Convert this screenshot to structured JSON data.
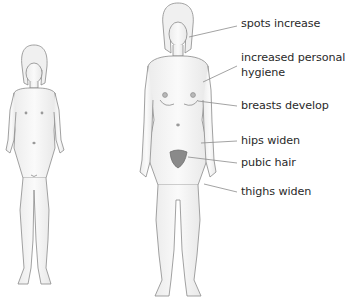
{
  "diagram": {
    "figures": [
      {
        "name": "girl-before-puberty"
      },
      {
        "name": "girl-after-puberty"
      }
    ],
    "labels": [
      {
        "id": "spots",
        "text": "spots increase",
        "top": 17
      },
      {
        "id": "hygiene_line1",
        "text": "increased personal",
        "top": 51
      },
      {
        "id": "hygiene_line2",
        "text": "hygiene",
        "top": 66
      },
      {
        "id": "breasts",
        "text": "breasts develop",
        "top": 99
      },
      {
        "id": "hips",
        "text": "hips widen",
        "top": 134
      },
      {
        "id": "pubic",
        "text": "pubic hair",
        "top": 156
      },
      {
        "id": "thighs",
        "text": "thighs widen",
        "top": 185
      }
    ],
    "colors": {
      "outline": "#8a8a8a",
      "skin": "#f4f4f4",
      "leader": "#8c8c8c",
      "text": "#2a2a2a"
    }
  }
}
